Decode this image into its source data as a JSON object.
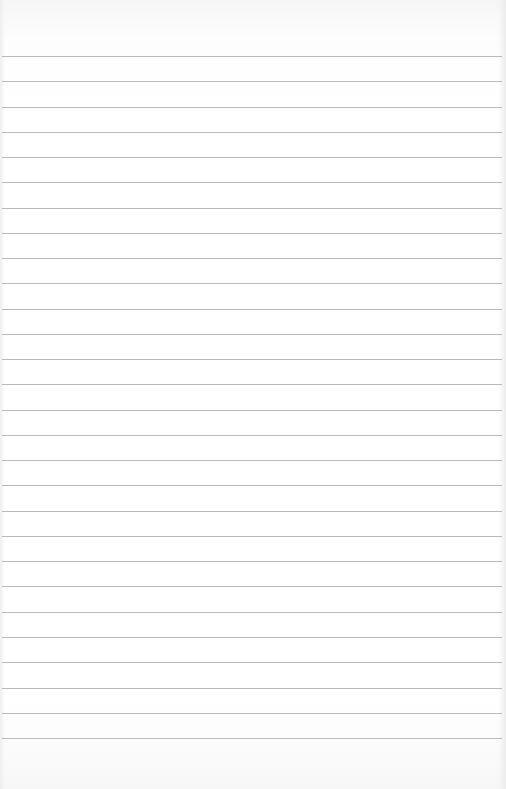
{
  "paper": {
    "type": "lined-paper",
    "line_count": 28,
    "first_line_y": 56,
    "line_spacing": 25.26,
    "line_color": "#b9b9b9",
    "background_color": "#ffffff"
  }
}
